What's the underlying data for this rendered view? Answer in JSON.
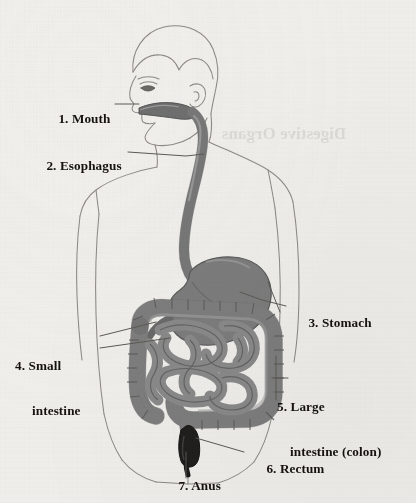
{
  "palette": {
    "paper": "#f1f0ed",
    "body_outline": "#8e8b86",
    "organ_mid": "#8d8d8d",
    "organ_dark": "#6f6f6f",
    "organ_light": "#a9a9a9",
    "rectum_dark": "#1d1b19",
    "leader_line": "#5d5a55",
    "label_text": "#16130f"
  },
  "labels": [
    {
      "id": "mouth",
      "number": "1.",
      "text": "1. Mouth",
      "line1": "1. Mouth",
      "line2": ""
    },
    {
      "id": "esophagus",
      "number": "2.",
      "text": "2. Esophagus",
      "line1": "2. Esophagus",
      "line2": ""
    },
    {
      "id": "stomach",
      "number": "3.",
      "text": "3. Stomach",
      "line1": "3. Stomach",
      "line2": ""
    },
    {
      "id": "small-intestine",
      "number": "4.",
      "text": "4. Small intestine",
      "line1": "4. Small",
      "line2": "intestine"
    },
    {
      "id": "large-intestine",
      "number": "5.",
      "text": "5. Large intestine (colon)",
      "line1": "5. Large",
      "line2": "intestine (colon)"
    },
    {
      "id": "rectum",
      "number": "6.",
      "text": "6. Rectum",
      "line1": "6. Rectum",
      "line2": ""
    },
    {
      "id": "anus",
      "number": "7.",
      "text": "7. Anus",
      "line1": "7. Anus",
      "line2": ""
    }
  ],
  "bleed_through": {
    "note": "faint reversed show-through text from the back of the page",
    "text": "Digestive Organs"
  }
}
